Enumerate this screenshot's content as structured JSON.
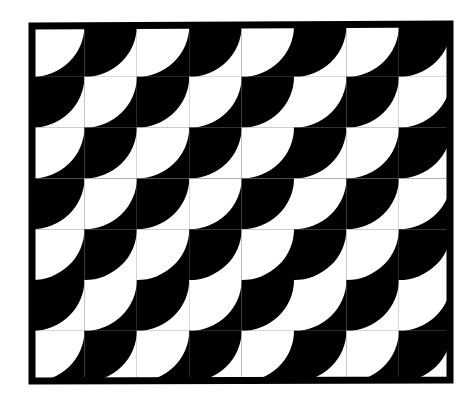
{
  "artwork": {
    "title": "Black and White Quarter-Circle Scale Pattern",
    "description": "A rectangular framed field filled with a repeating grid of quarter-circle arcs creating an interlocking fish-scale / fan motif in high-contrast black and white.",
    "medium": "line art",
    "canvas": {
      "width": 476,
      "height": 404,
      "background_color": "#ffffff"
    },
    "frame": {
      "name": "outer-border",
      "stroke_color": "#000000",
      "stroke_width": 7,
      "corners": {
        "top_left": [
          32,
          26
        ],
        "top_right": [
          450,
          24
        ],
        "bottom_right": [
          450,
          380
        ],
        "bottom_left": [
          32,
          381
        ]
      }
    },
    "grid": {
      "columns": 8,
      "rows": 7,
      "cell_width": 52.4,
      "cell_height": 50.8,
      "origin_x": 32,
      "origin_y": 26,
      "field_width": 419,
      "field_height": 356
    },
    "motif": {
      "shape": "quarter-circle",
      "arc_center": "top-left-of-cell",
      "radius_ratio": 1.0,
      "alternation": "checkerboard",
      "colors": {
        "ink": "#000000",
        "paper": "#ffffff"
      }
    },
    "cell_polarity": [
      [
        0,
        1,
        0,
        1,
        0,
        1,
        0,
        1
      ],
      [
        1,
        0,
        1,
        0,
        1,
        0,
        1,
        0
      ],
      [
        0,
        1,
        0,
        1,
        0,
        1,
        0,
        1
      ],
      [
        1,
        0,
        1,
        0,
        1,
        0,
        1,
        0
      ],
      [
        0,
        1,
        0,
        1,
        0,
        1,
        0,
        1
      ],
      [
        1,
        0,
        1,
        0,
        1,
        0,
        1,
        0
      ],
      [
        0,
        1,
        0,
        1,
        0,
        1,
        0,
        1
      ]
    ],
    "legend": {
      "polarity_0": "black cell with white quarter-circle",
      "polarity_1": "white cell with black quarter-circle"
    }
  }
}
